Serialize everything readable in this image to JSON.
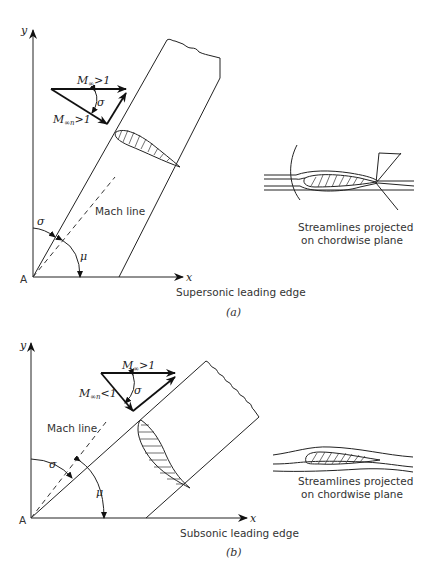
{
  "figure_a": {
    "axis_y": "y",
    "axis_x": "x",
    "origin": "A",
    "vector_top": {
      "symbol": "M",
      "subscript": "∞",
      "relation": ">1"
    },
    "vector_normal": {
      "symbol": "M",
      "subscript": "∞n",
      "relation": ">1"
    },
    "angle_sigma_vec": "σ",
    "angle_sigma": "σ",
    "angle_mu": "μ",
    "mach_line_label": "Mach line",
    "leading_edge_label": "Supersonic leading edge",
    "streamline_caption_1": "Streamlines projected",
    "streamline_caption_2": "on chordwise plane",
    "panel_label": "(a)"
  },
  "figure_b": {
    "axis_y": "y",
    "axis_x": "x",
    "origin": "A",
    "vector_top": {
      "symbol": "M",
      "subscript": "∞",
      "relation": ">1"
    },
    "vector_normal": {
      "symbol": "M",
      "subscript": "∞n",
      "relation": "<1"
    },
    "angle_sigma_vec": "σ",
    "angle_sigma": "σ",
    "angle_mu": "μ",
    "mach_line_label": "Mach line",
    "leading_edge_label": "Subsonic leading edge",
    "streamline_caption_1": "Streamlines projected",
    "streamline_caption_2": "on chordwise plane",
    "panel_label": "(b)"
  }
}
